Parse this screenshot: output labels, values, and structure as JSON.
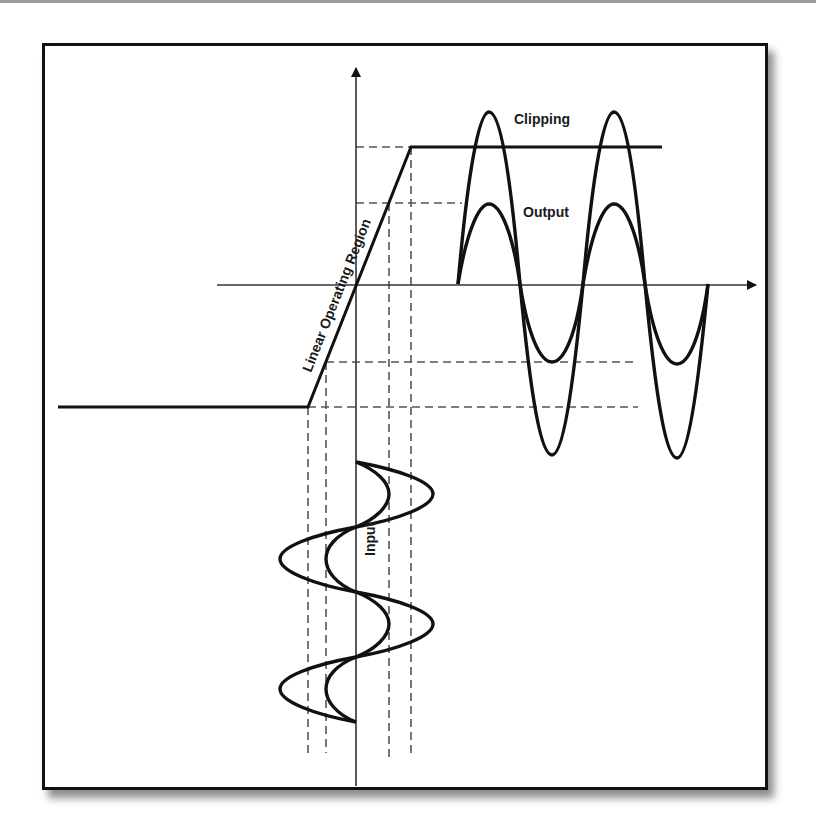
{
  "figure": {
    "labels": {
      "clipping": "Clipping",
      "output": "Output",
      "input": "Input",
      "linear_region": "Linear Operating Region"
    },
    "colors": {
      "line": "#111111",
      "axis": "#333333",
      "dashed": "#555555",
      "frame": "#111111",
      "background": "#ffffff"
    },
    "elements": {
      "axes": [
        "vertical-axis-with-arrow",
        "horizontal-axis-with-arrow"
      ],
      "transfer_curve": [
        "lower-saturation-line",
        "linear-slope",
        "upper-saturation-line"
      ],
      "waves": [
        "input-small-sine",
        "input-large-sine",
        "output-small-sine",
        "output-clipped-large-sine"
      ],
      "projection_lines": "dashed"
    }
  }
}
